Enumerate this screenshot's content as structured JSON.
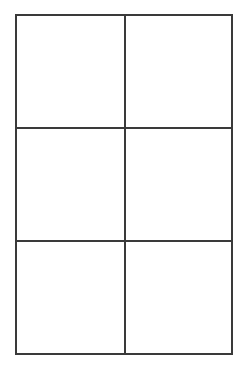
{
  "diagram": {
    "type": "grid",
    "rows": 3,
    "columns": 2,
    "line_color": "#3a3a3a",
    "background": "#ffffff",
    "cells": [
      {
        "row": 1,
        "col": 1,
        "label": ""
      },
      {
        "row": 1,
        "col": 2,
        "label": ""
      },
      {
        "row": 2,
        "col": 1,
        "label": ""
      },
      {
        "row": 2,
        "col": 2,
        "label": ""
      },
      {
        "row": 3,
        "col": 1,
        "label": ""
      },
      {
        "row": 3,
        "col": 2,
        "label": ""
      }
    ]
  }
}
